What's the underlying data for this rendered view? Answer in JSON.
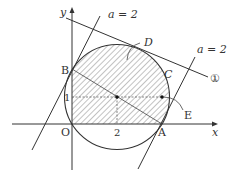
{
  "diagram": {
    "type": "coordinate-geometry",
    "axes": {
      "x_label": "x",
      "y_label": "y",
      "origin_label": "O"
    },
    "ticks": {
      "x_tick": "2",
      "y_tick": "1"
    },
    "points": {
      "A": "A",
      "B": "B",
      "O": "O"
    },
    "regions": {
      "C": "C",
      "D": "D",
      "E": "E"
    },
    "line_labels": {
      "tangent_left": "a = 2",
      "tangent_right": "a = 2",
      "line_1": "①"
    },
    "circle": {
      "center": [
        2,
        1
      ],
      "passes_through": [
        "O",
        "A",
        "B"
      ]
    },
    "colors": {
      "stroke": "#333333",
      "hatch": "#555555",
      "background": "#ffffff"
    }
  }
}
